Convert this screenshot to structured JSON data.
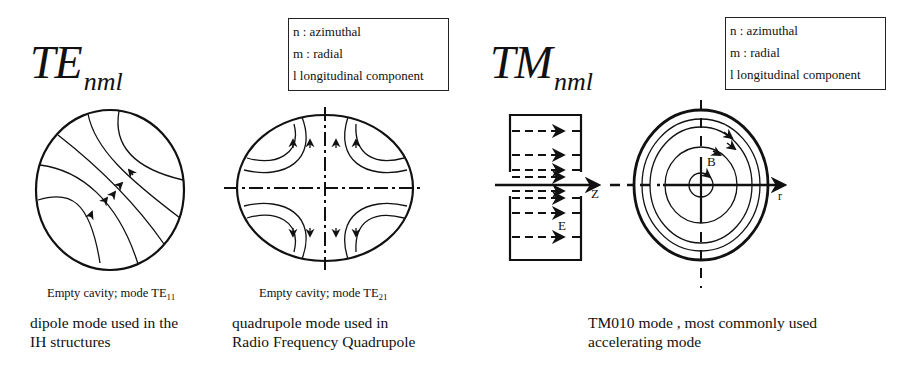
{
  "te_section": {
    "title_main": "TE",
    "title_sub": "nml",
    "legend": [
      "n : azimuthal",
      "m : radial",
      "l longitudinal component"
    ],
    "diagrams": [
      {
        "caption_prefix": "Empty cavity; mode TE",
        "caption_sub": "11",
        "description": [
          "dipole mode used in the",
          "IH structures"
        ]
      },
      {
        "caption_prefix": "Empty cavity; mode TE",
        "caption_sub": "21",
        "description": [
          "quadrupole mode used in",
          "Radio Frequency Quadrupole"
        ]
      }
    ]
  },
  "tm_section": {
    "title_main": "TM",
    "title_sub": "nml",
    "legend": [
      "n : azimuthal",
      "m : radial",
      "l longitudinal component"
    ],
    "axis_labels": {
      "z": "Z",
      "e_field": "E",
      "b_field": "B",
      "r": "r"
    },
    "description": [
      "TM010 mode , most commonly used",
      "accelerating mode"
    ]
  }
}
